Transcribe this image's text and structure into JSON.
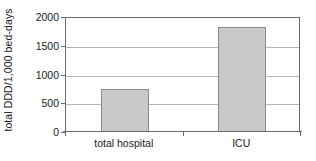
{
  "chart_data": {
    "type": "bar",
    "title": "",
    "subtitle": "",
    "xlabel": "",
    "ylabel": "total DDD/1,000 bed-days",
    "categories": [
      "total hospital",
      "ICU"
    ],
    "values": [
      750,
      1830
    ],
    "series": [
      {
        "name": "total DDD per 1,000 bed-days",
        "values": [
          750,
          1830
        ]
      }
    ],
    "ylim": [
      0,
      2000
    ],
    "ytick_labels": [
      "0",
      "500",
      "1000",
      "1500",
      "2000"
    ],
    "ytick_values": [
      0,
      500,
      1000,
      1500,
      2000
    ],
    "grid": "horizontal",
    "legend": "none",
    "bar_fill_color": "#c9c9c9",
    "bar_border_color": "#8a8a8a",
    "axis_color": "#6b6b6b",
    "gridline_color": "#b4b4b4",
    "text_color": "#1a1a1a"
  }
}
